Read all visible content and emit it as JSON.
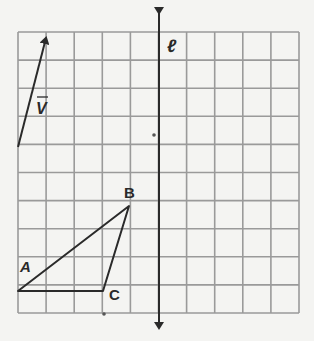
{
  "diagram": {
    "grid": {
      "left": 18,
      "top": 32,
      "cell": 28.1,
      "cols": 10,
      "rows": 10,
      "color": "#9a9a9a"
    },
    "line": {
      "label": "ℓ",
      "x": 159,
      "y1": 5,
      "y2": 336
    },
    "vector": {
      "label": "V",
      "from": [
        18,
        147
      ],
      "to": [
        46,
        32
      ]
    },
    "triangle": {
      "points": {
        "A": [
          18,
          291
        ],
        "B": [
          129,
          206
        ],
        "C": [
          103,
          291
        ]
      },
      "labels": {
        "A": "A",
        "B": "B",
        "C": "C"
      }
    },
    "dots": [
      [
        154,
        135
      ],
      [
        104,
        314
      ]
    ],
    "colors": {
      "ink": "#2a2a2a",
      "paper": "#f4f4f2"
    }
  }
}
